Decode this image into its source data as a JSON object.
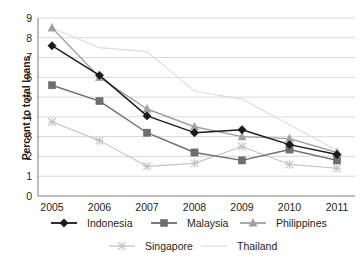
{
  "chart_data": {
    "type": "line",
    "title": "",
    "subtitle": "",
    "xlabel": "",
    "ylabel": "Percent to total loans",
    "categories": [
      "2005",
      "2006",
      "2007",
      "2008",
      "2009",
      "2010",
      "2011"
    ],
    "x": [
      2005,
      2006,
      2007,
      2008,
      2009,
      2010,
      2011
    ],
    "xlim": [
      2005,
      2011
    ],
    "ylim": [
      0,
      9
    ],
    "yticks": [
      "0",
      "1",
      "2",
      "3",
      "4",
      "5",
      "6",
      "7",
      "8",
      "9"
    ],
    "ytick_values": [
      0,
      1,
      2,
      3,
      4,
      5,
      6,
      7,
      8,
      9
    ],
    "grid": true,
    "grid_axis": "y",
    "legend_position": "bottom",
    "series": [
      {
        "name": "Indonesia",
        "color": "#1a1a1a",
        "marker": "diamond",
        "values": [
          7.6,
          6.1,
          4.05,
          3.2,
          3.35,
          2.6,
          2.1
        ]
      },
      {
        "name": "Malaysia",
        "color": "#6e6e6e",
        "marker": "square",
        "values": [
          5.6,
          4.8,
          3.2,
          2.2,
          1.8,
          2.35,
          1.8
        ]
      },
      {
        "name": "Philippines",
        "color": "#a0a0a0",
        "marker": "triangle",
        "values": [
          8.5,
          6.0,
          4.4,
          3.5,
          3.0,
          2.9,
          2.2
        ]
      },
      {
        "name": "Singapore",
        "color": "#c4c4c4",
        "marker": "x",
        "values": [
          3.75,
          2.8,
          1.5,
          1.65,
          2.5,
          1.6,
          1.4
        ]
      },
      {
        "name": "Thailand",
        "color": "#dcdcdc",
        "marker": "none",
        "values": [
          8.5,
          7.5,
          7.3,
          5.3,
          4.9,
          3.6,
          2.3
        ]
      }
    ]
  },
  "legend": {
    "entries": [
      {
        "label": "Indonesia"
      },
      {
        "label": "Malaysia"
      },
      {
        "label": "Philippines"
      },
      {
        "label": "Singapore"
      },
      {
        "label": "Thailand"
      }
    ]
  },
  "axes": {
    "y_title": "Percent to total loans"
  }
}
